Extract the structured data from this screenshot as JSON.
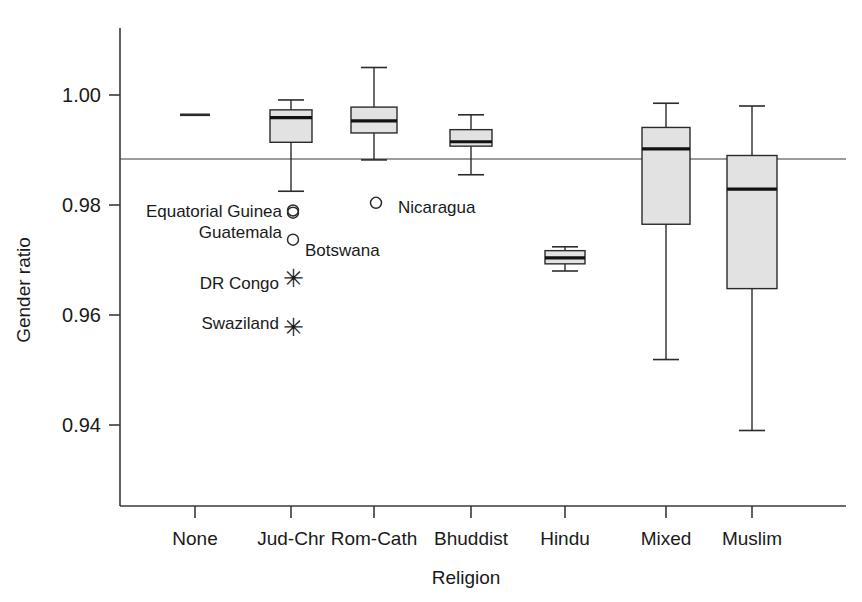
{
  "chart_data": {
    "type": "box",
    "title": "",
    "xlabel": "Religion",
    "ylabel": "Gender ratio",
    "categories": [
      "None",
      "Jud-Chr",
      "Rom-Cath",
      "Bhuddist",
      "Hindu",
      "Mixed",
      "Muslim"
    ],
    "ytick_labels": [
      "1.00",
      "0.98",
      "0.96",
      "0.94"
    ],
    "ytick_values": [
      1.0,
      0.98,
      0.96,
      0.94
    ],
    "ylim": [
      0.9305,
      1.0115
    ],
    "grid": false,
    "legend": "none",
    "reference_line": {
      "label": "overall mean",
      "value": 0.9876
    },
    "boxes": [
      {
        "category": "None",
        "single_value": 0.9964,
        "whisker_low": null,
        "q1": null,
        "median": 0.9964,
        "q3": null,
        "whisker_high": null
      },
      {
        "category": "Jud-Chr",
        "whisker_low": 0.9825,
        "q1": 0.9914,
        "median": 0.9959,
        "q3": 0.9973,
        "whisker_high": 0.9991
      },
      {
        "category": "Rom-Cath",
        "whisker_low": 0.9882,
        "q1": 0.9931,
        "median": 0.9953,
        "q3": 0.9978,
        "whisker_high": 1.005
      },
      {
        "category": "Bhuddist",
        "whisker_low": 0.9855,
        "q1": 0.9907,
        "median": 0.9915,
        "q3": 0.9937,
        "whisker_high": 0.9964
      },
      {
        "category": "Hindu",
        "whisker_low": 0.968,
        "q1": 0.9693,
        "median": 0.9704,
        "q3": 0.9717,
        "whisker_high": 0.9724
      },
      {
        "category": "Mixed",
        "whisker_low": 0.9519,
        "q1": 0.9765,
        "median": 0.9902,
        "q3": 0.9941,
        "whisker_high": 0.9985
      },
      {
        "category": "Muslim",
        "whisker_low": 0.939,
        "q1": 0.9648,
        "median": 0.9829,
        "q3": 0.989,
        "whisker_high": 0.998
      }
    ],
    "outliers": [
      {
        "label": "Equatorial Guinea",
        "category": "Jud-Chr",
        "value": 0.979,
        "marker": "circle",
        "label_side": "left"
      },
      {
        "label": "Guatemala",
        "category": "Jud-Chr",
        "value": 0.9786,
        "marker": "circle",
        "label_side": "left"
      },
      {
        "label": "Botswana",
        "category": "Jud-Chr",
        "value": 0.9737,
        "marker": "circle",
        "label_side": "right"
      },
      {
        "label": "DR Congo",
        "category": "Jud-Chr",
        "value": 0.9668,
        "marker": "star",
        "label_side": "left"
      },
      {
        "label": "Swaziland",
        "category": "Jud-Chr",
        "value": 0.9578,
        "marker": "star",
        "label_side": "left"
      },
      {
        "label": "Nicaragua",
        "category": "Rom-Cath",
        "value": 0.9804,
        "marker": "circle",
        "label_side": "right"
      }
    ],
    "star_glyph": "✳"
  }
}
